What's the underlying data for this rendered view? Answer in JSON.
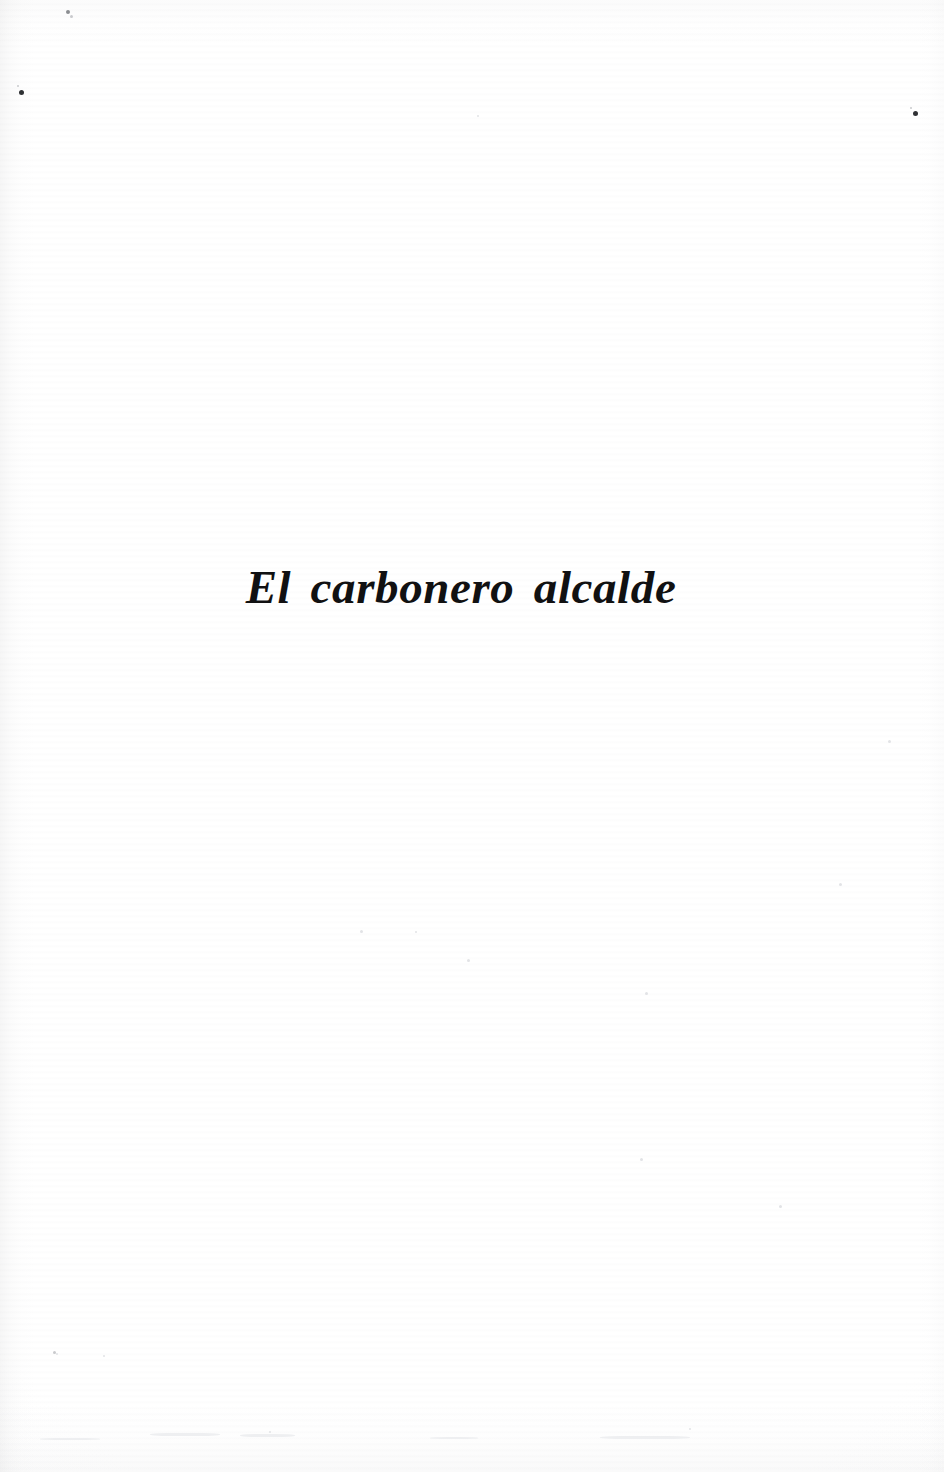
{
  "document": {
    "kind": "scanned-book-page",
    "page_type": "half-title / section divider",
    "language": "es",
    "background_color": "#ffffff",
    "text_color": "#111112"
  },
  "title": {
    "text": "El carbonero alcalde",
    "style": "bold-italic-serif",
    "alignment": "centered",
    "approx_font_size_px": 47
  },
  "artifacts": {
    "description": "scanner dust specks and faint paper texture",
    "specks": [
      {
        "x": 68,
        "y": 12,
        "size": 4,
        "tone": "mid"
      },
      {
        "x": 71,
        "y": 16,
        "size": 3,
        "tone": "faint"
      },
      {
        "x": 21,
        "y": 92,
        "size": 5,
        "tone": "dark"
      },
      {
        "x": 18,
        "y": 86,
        "size": 2,
        "tone": "faint"
      },
      {
        "x": 915,
        "y": 113,
        "size": 5,
        "tone": "dark"
      },
      {
        "x": 911,
        "y": 108,
        "size": 2,
        "tone": "faint"
      },
      {
        "x": 478,
        "y": 116,
        "size": 2,
        "tone": "ghost"
      },
      {
        "x": 840,
        "y": 884,
        "size": 3,
        "tone": "ghost"
      },
      {
        "x": 361,
        "y": 931,
        "size": 3,
        "tone": "ghost"
      },
      {
        "x": 416,
        "y": 932,
        "size": 2,
        "tone": "ghost"
      },
      {
        "x": 468,
        "y": 960,
        "size": 3,
        "tone": "ghost"
      },
      {
        "x": 646,
        "y": 993,
        "size": 3,
        "tone": "ghost"
      },
      {
        "x": 641,
        "y": 1159,
        "size": 3,
        "tone": "ghost"
      },
      {
        "x": 780,
        "y": 1206,
        "size": 3,
        "tone": "ghost"
      },
      {
        "x": 54,
        "y": 1352,
        "size": 3,
        "tone": "faint"
      },
      {
        "x": 104,
        "y": 1356,
        "size": 2,
        "tone": "ghost"
      },
      {
        "x": 57,
        "y": 1354,
        "size": 2,
        "tone": "ghost"
      },
      {
        "x": 270,
        "y": 1432,
        "size": 2,
        "tone": "ghost"
      },
      {
        "x": 690,
        "y": 1429,
        "size": 2,
        "tone": "ghost"
      },
      {
        "x": 889,
        "y": 741,
        "size": 3,
        "tone": "ghost"
      }
    ],
    "smudges": [
      {
        "x": 150,
        "y": 1433,
        "w": 70,
        "h": 3
      },
      {
        "x": 240,
        "y": 1434,
        "w": 55,
        "h": 3
      },
      {
        "x": 600,
        "y": 1436,
        "w": 90,
        "h": 3
      },
      {
        "x": 40,
        "y": 1438,
        "w": 60,
        "h": 2
      },
      {
        "x": 430,
        "y": 1437,
        "w": 48,
        "h": 2
      }
    ]
  }
}
